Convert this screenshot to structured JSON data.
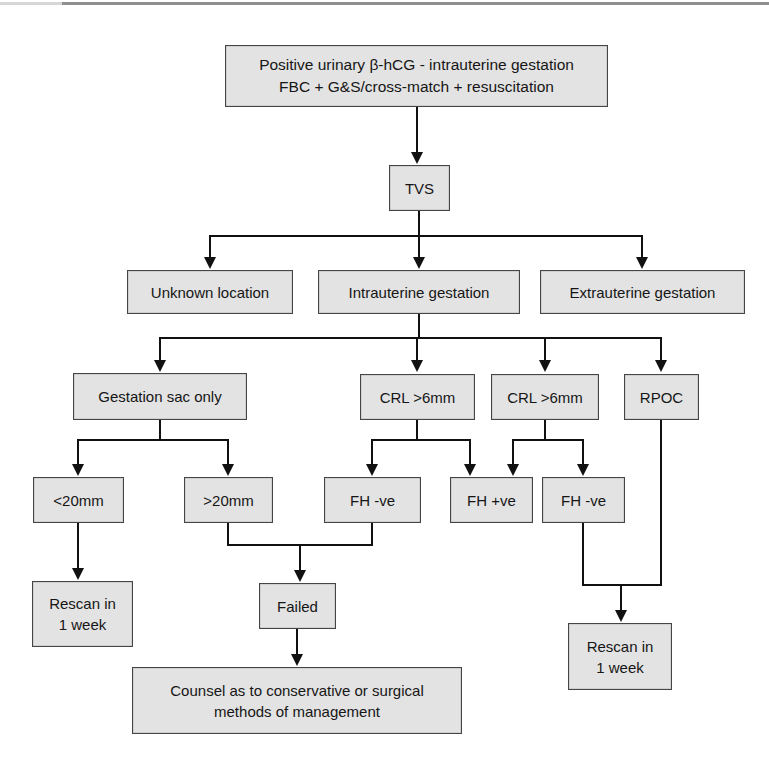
{
  "page": {
    "background": "#ffffff",
    "top_rule_color": "#8f8f8f",
    "top_rule_left_color": "#d6d6d6"
  },
  "diagram": {
    "type": "flowchart",
    "box_fill": "#e3e3e3",
    "box_border": "#454545",
    "line_color": "#111111",
    "nodes": {
      "start": {
        "label": "Positive urinary β-hCG - intrauterine gestation\nFBC + G&S/cross-match + resuscitation"
      },
      "tvs": {
        "label": "TVS"
      },
      "unknown": {
        "label": "Unknown location"
      },
      "intrauterine": {
        "label": "Intrauterine gestation"
      },
      "extrauterine": {
        "label": "Extrauterine gestation"
      },
      "sac": {
        "label": "Gestation sac only"
      },
      "crl1": {
        "label": "CRL >6mm"
      },
      "crl2": {
        "label": "CRL >6mm"
      },
      "rpoc": {
        "label": "RPOC"
      },
      "lt20": {
        "label": "<20mm"
      },
      "gt20": {
        "label": ">20mm"
      },
      "fhneg1": {
        "label": "FH -ve"
      },
      "fhpos": {
        "label": "FH +ve"
      },
      "fhneg2": {
        "label": "FH -ve"
      },
      "rescan1": {
        "label": "Rescan in\n1 week"
      },
      "failed": {
        "label": "Failed"
      },
      "counsel": {
        "label": "Counsel as to conservative or surgical\nmethods of management"
      },
      "rescan2": {
        "label": "Rescan in\n1 week"
      }
    },
    "edges": [
      {
        "from": "start",
        "to": "tvs"
      },
      {
        "from": "tvs",
        "to": "unknown"
      },
      {
        "from": "tvs",
        "to": "intrauterine"
      },
      {
        "from": "tvs",
        "to": "extrauterine"
      },
      {
        "from": "intrauterine",
        "to": "sac"
      },
      {
        "from": "intrauterine",
        "to": "crl1"
      },
      {
        "from": "intrauterine",
        "to": "crl2"
      },
      {
        "from": "intrauterine",
        "to": "rpoc"
      },
      {
        "from": "sac",
        "to": "lt20"
      },
      {
        "from": "sac",
        "to": "gt20"
      },
      {
        "from": "crl1",
        "to": "fhneg1"
      },
      {
        "from": "crl1",
        "to": "fhpos"
      },
      {
        "from": "crl2",
        "to": "fhpos"
      },
      {
        "from": "crl2",
        "to": "fhneg2"
      },
      {
        "from": "lt20",
        "to": "rescan1"
      },
      {
        "from": "gt20",
        "to": "failed"
      },
      {
        "from": "fhneg1",
        "to": "failed"
      },
      {
        "from": "failed",
        "to": "counsel"
      },
      {
        "from": "fhneg2",
        "to": "rescan2"
      },
      {
        "from": "rpoc",
        "to": "rescan2"
      }
    ]
  }
}
